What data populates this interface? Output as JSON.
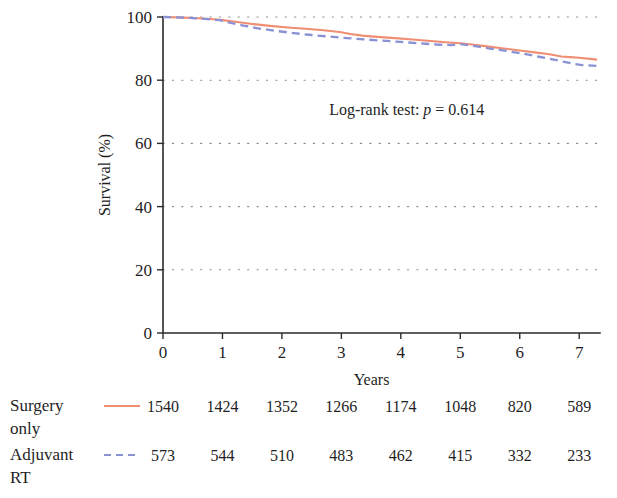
{
  "chart_data": {
    "type": "line",
    "title": "",
    "xlabel": "Years",
    "ylabel": "Survival (%)",
    "xlim": [
      0,
      7.35
    ],
    "ylim": [
      0,
      100
    ],
    "xticks": [
      0,
      1,
      2,
      3,
      4,
      5,
      6,
      7
    ],
    "xticklabels": [
      "0",
      "1",
      "2",
      "3",
      "4",
      "5",
      "6",
      "7"
    ],
    "yticks": [
      0,
      20,
      40,
      60,
      80,
      100
    ],
    "yticklabels": [
      "0",
      "20",
      "40",
      "60",
      "80",
      "100"
    ],
    "grid": "horizontal-dotted",
    "legend_position": "below-axes-risk-table",
    "annotations": [
      {
        "name": "log-rank-annotation",
        "prefix": "Log-rank test: ",
        "italic": "p",
        "suffix": " = 0.614",
        "x": 4.1,
        "y": 69
      }
    ],
    "series": [
      {
        "name": "Surgery only",
        "color": "#ef8e72",
        "style": "solid",
        "x": [
          0,
          0.15,
          0.35,
          0.6,
          0.85,
          1.0,
          1.25,
          1.5,
          1.8,
          2.1,
          2.4,
          2.7,
          3.0,
          3.15,
          3.35,
          3.6,
          3.9,
          4.2,
          4.5,
          4.75,
          5.0,
          5.2,
          5.45,
          5.7,
          6.0,
          6.25,
          6.5,
          6.7,
          6.85,
          7.0,
          7.3
        ],
        "y": [
          100,
          99.9,
          99.8,
          99.6,
          99.3,
          99.0,
          98.4,
          97.8,
          97.2,
          96.7,
          96.3,
          95.8,
          95.2,
          94.6,
          94.1,
          93.7,
          93.3,
          92.9,
          92.4,
          92.0,
          91.7,
          91.3,
          90.7,
          90.1,
          89.4,
          88.8,
          88.2,
          87.5,
          87.3,
          87.1,
          86.5
        ]
      },
      {
        "name": "Adjuvant RT",
        "color": "#8b92d4",
        "style": "dashed",
        "x": [
          0,
          0.2,
          0.45,
          0.7,
          0.95,
          1.1,
          1.35,
          1.6,
          1.9,
          2.2,
          2.5,
          2.8,
          3.1,
          3.4,
          3.7,
          4.0,
          4.3,
          4.6,
          4.85,
          5.0,
          5.25,
          5.5,
          5.8,
          6.05,
          6.3,
          6.55,
          6.75,
          6.9,
          7.05,
          7.3
        ],
        "y": [
          100,
          99.9,
          99.7,
          99.4,
          99.0,
          98.3,
          97.3,
          96.4,
          95.6,
          94.9,
          94.3,
          93.8,
          93.3,
          92.9,
          92.5,
          92.1,
          91.7,
          91.3,
          91.1,
          91.4,
          90.8,
          90.0,
          89.2,
          88.4,
          87.5,
          86.6,
          85.8,
          85.2,
          84.8,
          84.5
        ]
      }
    ]
  },
  "risk_table": {
    "rows": [
      {
        "label_line1": "Surgery",
        "label_line2": "only",
        "marker": "solid-line-swatch",
        "color": "#ef8e72",
        "counts": [
          "1540",
          "1424",
          "1352",
          "1266",
          "1174",
          "1048",
          "820",
          "589"
        ]
      },
      {
        "label_line1": "Adjuvant",
        "label_line2": "RT",
        "marker": "dashed-line-swatch",
        "color": "#8b92d4",
        "counts": [
          "573",
          "544",
          "510",
          "483",
          "462",
          "415",
          "332",
          "233"
        ]
      }
    ]
  }
}
